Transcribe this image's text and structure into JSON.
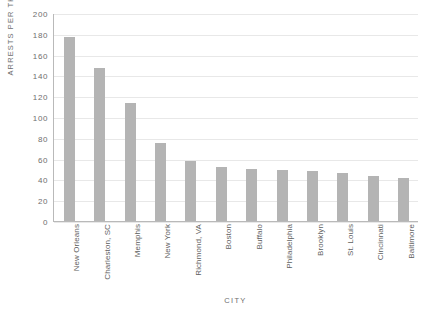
{
  "chart_data": {
    "type": "bar",
    "title": "",
    "xlabel": "CITY",
    "ylabel": "ARRESTS PER THOUSAND",
    "ylim": [
      0,
      200
    ],
    "ytick_step": 20,
    "yticks": [
      0,
      20,
      40,
      60,
      80,
      100,
      120,
      140,
      160,
      180,
      200
    ],
    "ytick_labels": [
      "0",
      "20",
      "40",
      "60",
      "80",
      "100",
      "120",
      "140",
      "160",
      "180",
      "200"
    ],
    "grid": true,
    "legend": false,
    "bar_color": "#b4b4b4",
    "grid_color": "#e8e8e8",
    "axis_color": "#b9b9b9",
    "text_color": "#6e6e6e",
    "categories": [
      "New Orleans",
      "Charleston, SC",
      "Memphis",
      "New York",
      "Richmond, VA",
      "Boston",
      "Buffalo",
      "Philadelphia",
      "Brooklyn",
      "St. Louis",
      "Cincinnati",
      "Baltimore"
    ],
    "values": [
      177,
      147,
      113,
      75,
      58,
      52,
      50,
      49,
      48,
      46,
      43,
      41
    ]
  }
}
